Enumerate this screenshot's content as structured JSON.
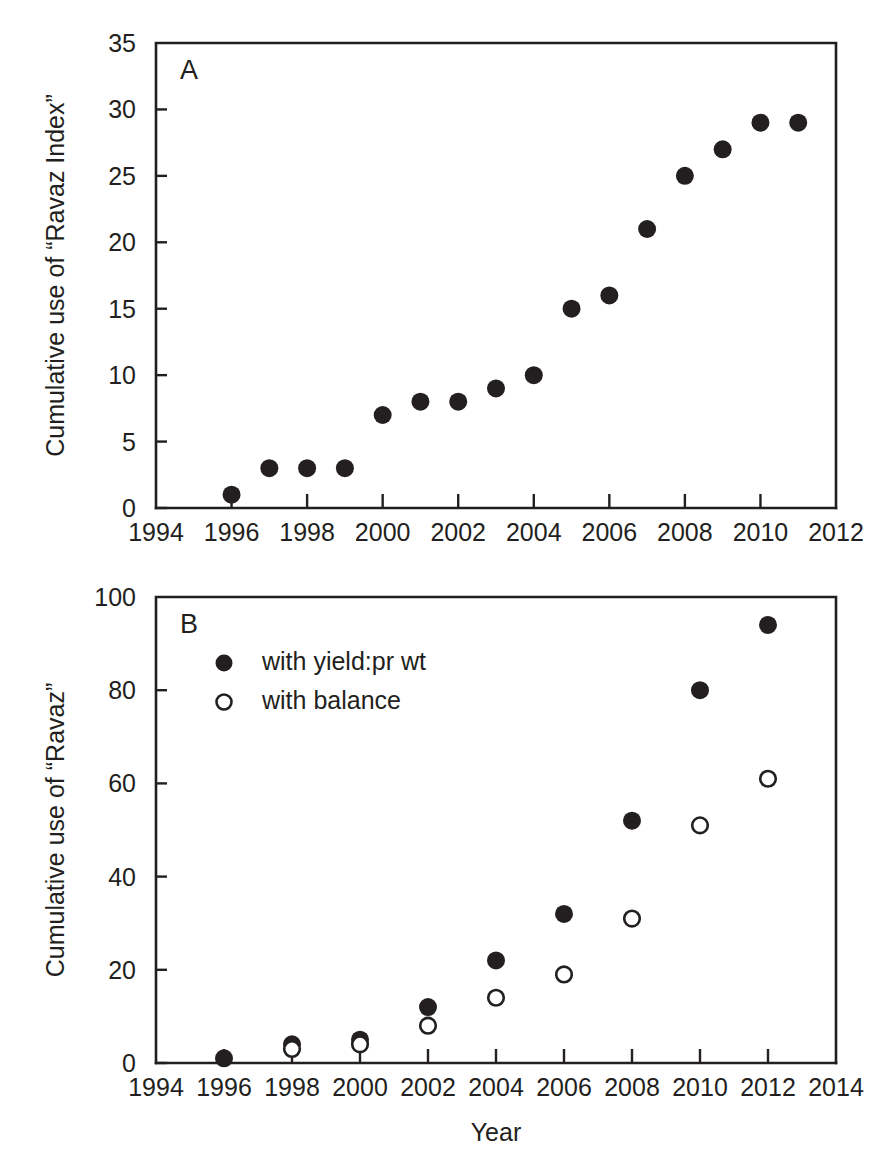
{
  "figure": {
    "background": "#ffffff",
    "ink_color": "#231f20",
    "xlabel": "Year"
  },
  "chart_data": [
    {
      "id": "panel-a",
      "type": "scatter",
      "panel_label": "A",
      "title": "",
      "xlabel": "",
      "ylabel": "Cumulative use of “Ravaz Index”",
      "xlim": [
        1994,
        2012
      ],
      "ylim": [
        0,
        35
      ],
      "xticks": [
        1994,
        1996,
        1998,
        2000,
        2002,
        2004,
        2006,
        2008,
        2010,
        2012
      ],
      "xticklabels": [
        "1994",
        "1996",
        "1998",
        "2000",
        "2002",
        "2004",
        "2006",
        "2008",
        "2010",
        "2012"
      ],
      "xminorticks": [
        1995,
        1997,
        1999,
        2001,
        2003,
        2005,
        2007,
        2009,
        2011
      ],
      "yticks": [
        0,
        5,
        10,
        15,
        20,
        25,
        30,
        35
      ],
      "yticklabels": [
        "0",
        "5",
        "10",
        "15",
        "20",
        "25",
        "30",
        "35"
      ],
      "grid": false,
      "legend": null,
      "series": [
        {
          "name": "Ravaz Index",
          "marker": "filled-circle",
          "color": "#231f20",
          "x": [
            1996,
            1997,
            1998,
            1999,
            2000,
            2001,
            2002,
            2003,
            2004,
            2005,
            2006,
            2007,
            2008,
            2009,
            2010,
            2011
          ],
          "y": [
            1,
            3,
            3,
            3,
            7,
            8,
            8,
            9,
            10,
            15,
            16,
            21,
            25,
            27,
            29,
            29
          ]
        }
      ]
    },
    {
      "id": "panel-b",
      "type": "scatter",
      "panel_label": "B",
      "title": "",
      "xlabel": "Year",
      "ylabel": "Cumulative use of “Ravaz”",
      "xlim": [
        1994,
        2014
      ],
      "ylim": [
        0,
        100
      ],
      "xticks": [
        1994,
        1996,
        1998,
        2000,
        2002,
        2004,
        2006,
        2008,
        2010,
        2012,
        2014
      ],
      "xticklabels": [
        "1994",
        "1996",
        "1998",
        "2000",
        "2002",
        "2004",
        "2006",
        "2008",
        "2010",
        "2012",
        "2014"
      ],
      "xminorticks": [
        1995,
        1997,
        1999,
        2001,
        2003,
        2005,
        2007,
        2009,
        2011,
        2013
      ],
      "yticks": [
        0,
        20,
        40,
        60,
        80,
        100
      ],
      "yticklabels": [
        "0",
        "20",
        "40",
        "60",
        "80",
        "100"
      ],
      "grid": false,
      "legend": {
        "position": "top-left-inside",
        "entries": [
          {
            "label": "with yield:pr wt",
            "marker": "filled-circle"
          },
          {
            "label": "with balance",
            "marker": "open-circle"
          }
        ]
      },
      "series": [
        {
          "name": "with yield:pr wt",
          "marker": "filled-circle",
          "color": "#231f20",
          "x": [
            1996,
            1998,
            2000,
            2002,
            2004,
            2006,
            2008,
            2010,
            2012
          ],
          "y": [
            1,
            4,
            5,
            12,
            22,
            32,
            52,
            80,
            94
          ]
        },
        {
          "name": "with balance",
          "marker": "open-circle",
          "color": "#231f20",
          "x": [
            1998,
            2000,
            2002,
            2004,
            2006,
            2008,
            2010,
            2012
          ],
          "y": [
            3,
            4,
            8,
            14,
            19,
            31,
            51,
            61
          ]
        }
      ]
    }
  ]
}
